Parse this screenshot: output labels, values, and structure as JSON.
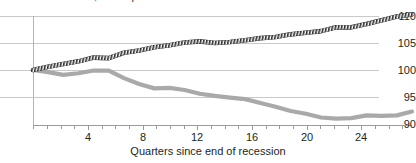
{
  "topnote": {
    "text": "1991 and 2001 recessions; recent expansion"
  },
  "axes": {
    "y_ticks": [
      "110",
      "105",
      "100",
      "95",
      "90"
    ],
    "x_ticks": [
      "4",
      "8",
      "12",
      "16",
      "20",
      "24"
    ],
    "x_title": "Quarters since end of recession",
    "y_title": ""
  },
  "colors": {
    "series_dark": "#2b2b2b",
    "series_gray": "#a9a9a9",
    "grid": "#c9c9c9",
    "axis": "#9a9a9a",
    "text": "#231f20",
    "background": "#ffffff"
  },
  "chart_data": {
    "type": "line",
    "title": "",
    "xlabel": "Quarters since end of recession",
    "ylabel": "",
    "xlim": [
      0,
      25
    ],
    "ylim": [
      88.5,
      111.5
    ],
    "grid": true,
    "legend": "none",
    "x": [
      0,
      1,
      2,
      3,
      4,
      5,
      6,
      7,
      8,
      9,
      10,
      11,
      12,
      13,
      14,
      15,
      16,
      17,
      18,
      19,
      20,
      21,
      22,
      23,
      24,
      25
    ],
    "series": [
      {
        "name": "Upper series (hatched dark)",
        "style": "hatched",
        "color": "#2b2b2b",
        "values": [
          100.0,
          100.6,
          101.1,
          101.6,
          102.3,
          102.2,
          103.2,
          103.6,
          104.2,
          104.6,
          105.1,
          105.3,
          105.0,
          105.2,
          105.5,
          105.9,
          106.1,
          106.6,
          106.9,
          107.2,
          107.9,
          107.9,
          108.5,
          109.2,
          109.9,
          110.3
        ]
      },
      {
        "name": "Lower series (solid gray)",
        "style": "solid",
        "color": "#a9a9a9",
        "values": [
          100.0,
          99.6,
          99.1,
          99.4,
          99.9,
          99.9,
          98.5,
          97.4,
          96.6,
          96.7,
          96.3,
          95.6,
          95.2,
          94.9,
          94.6,
          93.9,
          93.2,
          92.4,
          91.9,
          91.2,
          91.0,
          91.1,
          91.6,
          91.5,
          91.6,
          92.3
        ]
      }
    ]
  }
}
